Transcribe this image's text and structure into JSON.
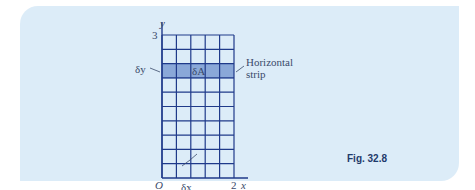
{
  "figure": {
    "caption": "Fig. 32.8",
    "axis": {
      "x_label": "x",
      "y_label": "y",
      "origin_label": "O",
      "x_max_label": "2",
      "y_max_label": "3"
    },
    "grid": {
      "columns": 5,
      "rows": 10,
      "highlighted_row": 2
    },
    "labels": {
      "strip_area": "δA",
      "delta_y": "δy",
      "delta_x": "δx",
      "strip_line1": "Horizontal",
      "strip_line2": "strip"
    },
    "colors": {
      "panel_bg": "#dcecf8",
      "grid_line": "#1f3a8a",
      "strip_fill": "#8aa8d8",
      "caption": "#1f3a6b"
    }
  }
}
